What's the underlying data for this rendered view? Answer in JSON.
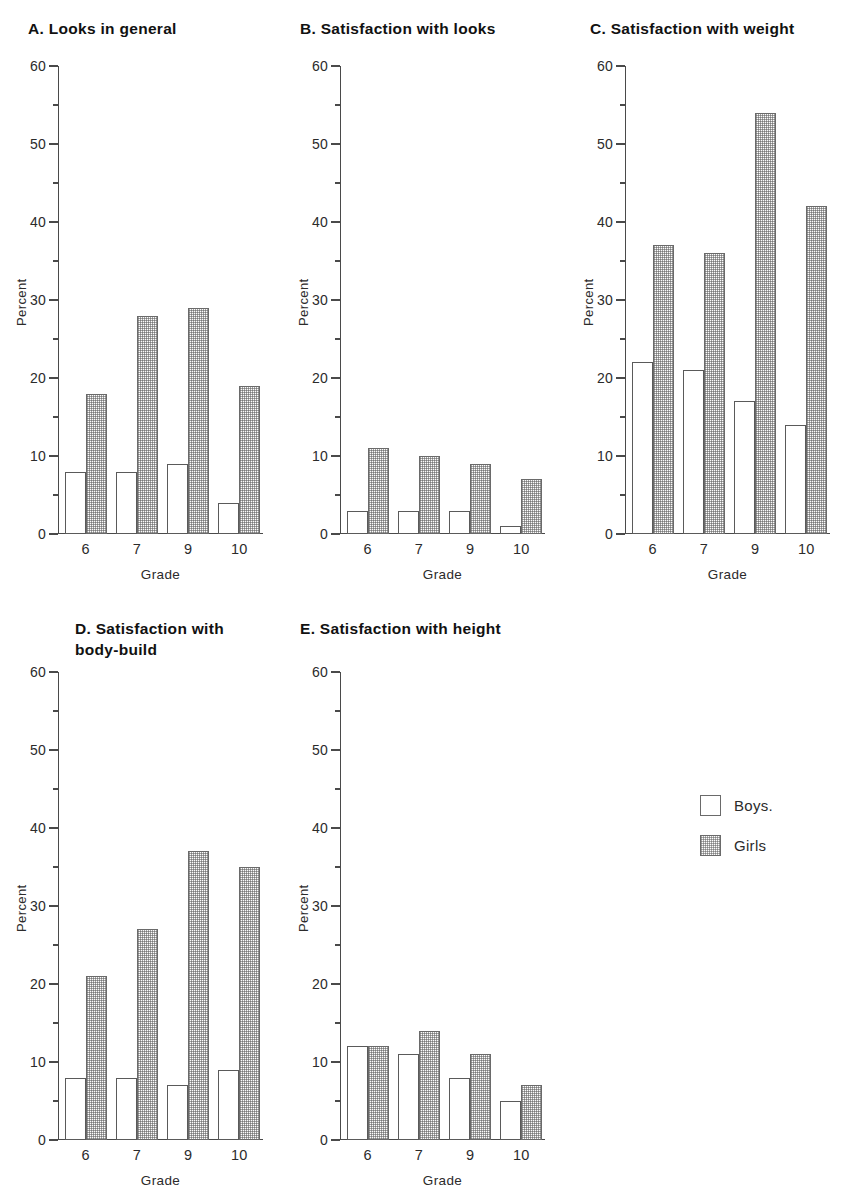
{
  "figure": {
    "background": "#ffffff",
    "axis_color": "#4a4a4a",
    "bar_outline_color": "#5a5a5a",
    "boys_fill": "#ffffff",
    "girls_fill": "#e8e8e8"
  },
  "legend": {
    "position": "right-middle",
    "entries": [
      {
        "label": "Boys.",
        "swatch": "boys"
      },
      {
        "label": "Girls",
        "swatch": "girls"
      }
    ]
  },
  "chart_data": [
    {
      "type": "bar",
      "panel": "A",
      "title": "A. Looks in general",
      "xlabel": "Grade",
      "ylabel": "Percent",
      "categories": [
        "6",
        "7",
        "9",
        "10"
      ],
      "ylim": [
        0,
        60
      ],
      "yticks": [
        0,
        10,
        20,
        30,
        40,
        50,
        60
      ],
      "yticks_minor": [
        5,
        15,
        25,
        35,
        45,
        55
      ],
      "grid": false,
      "series": [
        {
          "name": "Boys.",
          "values": [
            8,
            8,
            9,
            4
          ]
        },
        {
          "name": "Girls",
          "values": [
            18,
            28,
            29,
            19
          ]
        }
      ]
    },
    {
      "type": "bar",
      "panel": "B",
      "title": "B. Satisfaction with looks",
      "xlabel": "Grade",
      "ylabel": "Percent",
      "categories": [
        "6",
        "7",
        "9",
        "10"
      ],
      "ylim": [
        0,
        60
      ],
      "yticks": [
        0,
        10,
        20,
        30,
        40,
        50,
        60
      ],
      "yticks_minor": [
        5,
        15,
        25,
        35,
        45,
        55
      ],
      "grid": false,
      "series": [
        {
          "name": "Boys.",
          "values": [
            3,
            3,
            3,
            1
          ]
        },
        {
          "name": "Girls",
          "values": [
            11,
            10,
            9,
            7
          ]
        }
      ]
    },
    {
      "type": "bar",
      "panel": "C",
      "title": "C. Satisfaction with weight",
      "xlabel": "Grade",
      "ylabel": "Percent",
      "categories": [
        "6",
        "7",
        "9",
        "10"
      ],
      "ylim": [
        0,
        60
      ],
      "yticks": [
        0,
        10,
        20,
        30,
        40,
        50,
        60
      ],
      "yticks_minor": [
        5,
        15,
        25,
        35,
        45,
        55
      ],
      "grid": false,
      "series": [
        {
          "name": "Boys.",
          "values": [
            22,
            21,
            17,
            14
          ]
        },
        {
          "name": "Girls",
          "values": [
            37,
            36,
            54,
            42
          ]
        }
      ]
    },
    {
      "type": "bar",
      "panel": "D",
      "title": "D. Satisfaction with\nbody-build",
      "xlabel": "Grade",
      "ylabel": "Percent",
      "categories": [
        "6",
        "7",
        "9",
        "10"
      ],
      "ylim": [
        0,
        60
      ],
      "yticks": [
        0,
        10,
        20,
        30,
        40,
        50,
        60
      ],
      "yticks_minor": [
        5,
        15,
        25,
        35,
        45,
        55
      ],
      "grid": false,
      "series": [
        {
          "name": "Boys.",
          "values": [
            8,
            8,
            7,
            9
          ]
        },
        {
          "name": "Girls",
          "values": [
            21,
            27,
            37,
            35
          ]
        }
      ]
    },
    {
      "type": "bar",
      "panel": "E",
      "title": "E. Satisfaction with height",
      "xlabel": "Grade",
      "ylabel": "Percent",
      "categories": [
        "6",
        "7",
        "9",
        "10"
      ],
      "ylim": [
        0,
        60
      ],
      "yticks": [
        0,
        10,
        20,
        30,
        40,
        50,
        60
      ],
      "yticks_minor": [
        5,
        15,
        25,
        35,
        45,
        55
      ],
      "grid": false,
      "series": [
        {
          "name": "Boys.",
          "values": [
            12,
            11,
            8,
            5
          ]
        },
        {
          "name": "Girls",
          "values": [
            12,
            14,
            11,
            7
          ]
        }
      ]
    }
  ],
  "layout": {
    "panels": [
      {
        "panel": "A",
        "title_x": 28,
        "title_y": 18,
        "title_w": 250,
        "plot_x": 58,
        "plot_y": 66,
        "plot_w": 205,
        "plot_h": 468
      },
      {
        "panel": "B",
        "title_x": 300,
        "title_y": 18,
        "title_w": 270,
        "plot_x": 340,
        "plot_y": 66,
        "plot_w": 205,
        "plot_h": 468
      },
      {
        "panel": "C",
        "title_x": 590,
        "title_y": 18,
        "title_w": 260,
        "plot_x": 625,
        "plot_y": 66,
        "plot_w": 205,
        "plot_h": 468
      },
      {
        "panel": "D",
        "title_x": 75,
        "title_y": 618,
        "title_w": 230,
        "plot_x": 58,
        "plot_y": 672,
        "plot_w": 205,
        "plot_h": 468
      },
      {
        "panel": "E",
        "title_x": 300,
        "title_y": 618,
        "title_w": 270,
        "plot_x": 340,
        "plot_y": 672,
        "plot_w": 205,
        "plot_h": 468
      }
    ],
    "legend_x": 700,
    "legend_y": 795
  }
}
